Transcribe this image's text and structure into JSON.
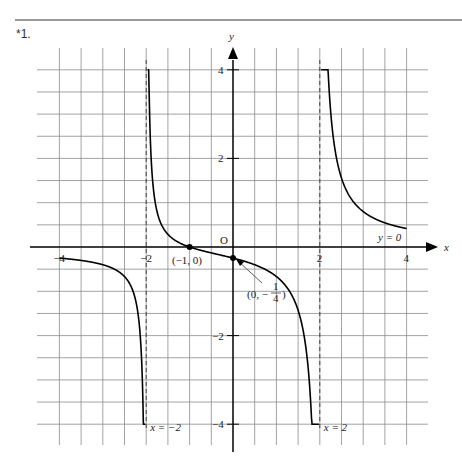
{
  "problem_label": "*1.",
  "graph": {
    "function": "f(x) = (x+1)/(x^2-4)",
    "x_axis_label": "x",
    "y_axis_label": "y",
    "origin_label": "O",
    "x_ticks": [
      {
        "value": -4,
        "label": "−4"
      },
      {
        "value": -2,
        "label": "−2"
      },
      {
        "value": 2,
        "label": "2"
      },
      {
        "value": 4,
        "label": "4"
      }
    ],
    "y_ticks": [
      {
        "value": 4,
        "label": "4"
      },
      {
        "value": 2,
        "label": "2"
      },
      {
        "value": -2,
        "label": "−2"
      },
      {
        "value": -4,
        "label": "−4"
      }
    ],
    "asymptotes": {
      "vertical": [
        {
          "x": -2,
          "label": "x = −2"
        },
        {
          "x": 2,
          "label": "x = 2"
        }
      ],
      "horizontal": [
        {
          "y": 0,
          "label": "y = 0"
        }
      ]
    },
    "points": [
      {
        "x": -1,
        "y": 0,
        "label": "(−1, 0)"
      },
      {
        "x": 0,
        "y": -0.25,
        "label_prefix": "(0, −",
        "label_num": "1",
        "label_den": "4",
        "label_suffix": ")"
      }
    ],
    "grid_step": 0.5,
    "x_range": [
      -4,
      4
    ],
    "y_range": [
      -4,
      4
    ],
    "colors": {
      "grid": "#8c8c8c",
      "axis": "#000000",
      "curve": "#000000"
    }
  }
}
